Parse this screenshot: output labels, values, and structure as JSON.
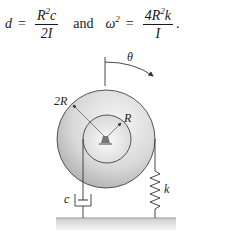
{
  "equation": {
    "lhs1": "d",
    "eq1": "=",
    "frac1_num_base": "R",
    "frac1_num_sup": "2",
    "frac1_num_tail": "c",
    "frac1_den": "2I",
    "connector": "and",
    "lhs2_base": "ω",
    "lhs2_sup": "2",
    "eq2": "=",
    "frac2_num_head": "4R",
    "frac2_num_sup": "2",
    "frac2_num_tail": "k",
    "frac2_den": "I",
    "end": "."
  },
  "diagram": {
    "labels": {
      "theta": "θ",
      "outer_radius": "2R",
      "inner_radius": "R",
      "damper": "c",
      "spring": "k"
    },
    "colors": {
      "line": "#333333",
      "disk_light": "#f2f2f2",
      "disk_dark": "#b8b8b8",
      "ground": "#d9d9d9"
    }
  }
}
